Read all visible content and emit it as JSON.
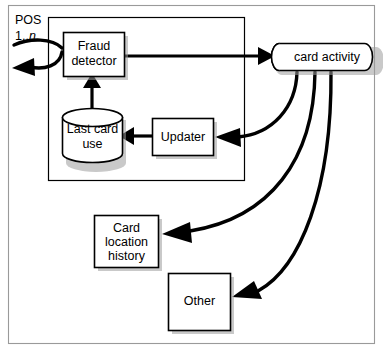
{
  "diagram": {
    "title_label": "POS",
    "title_sub_prefix": "1..",
    "title_sub_italic": "n",
    "nodes": {
      "fraud_detector": {
        "line1": "Fraud",
        "line2": "detector"
      },
      "last_card_use": {
        "line1": "Last card",
        "line2": "use"
      },
      "updater": {
        "line1": "Updater"
      },
      "card_activity": {
        "line1": "card activity"
      },
      "card_location_history": {
        "line1": "Card",
        "line2": "location",
        "line3": "history"
      },
      "other": {
        "line1": "Other"
      }
    },
    "colors": {
      "shape_fill": "#ffffff",
      "shape_stroke": "#000000",
      "edge_stroke": "#000000",
      "frame_stroke": "#9a9a9a",
      "shadow": "#9d9d9d",
      "text": "#000000",
      "background": "#ffffff"
    }
  }
}
